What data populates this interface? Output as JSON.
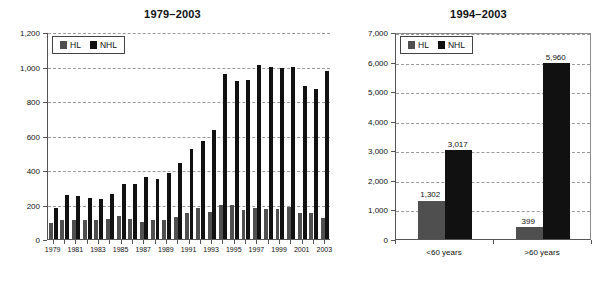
{
  "figure": {
    "background": "#ffffff",
    "hl_color": "#4f4f4f",
    "nhl_color": "#111111",
    "grid_color": "#9a9a9a",
    "axis_color": "#555555"
  },
  "legend": {
    "hl_label": "HL",
    "nhl_label": "NHL"
  },
  "chart_data": [
    {
      "type": "bar",
      "id": "left",
      "title": "1979–2003",
      "xlabel": "",
      "ylabel": "",
      "ylim": [
        0,
        1200
      ],
      "yticks": [
        0,
        200,
        400,
        600,
        800,
        1000,
        1200
      ],
      "ytick_labels": [
        "0",
        "200",
        "400",
        "600",
        "800",
        "1,000",
        "1,200"
      ],
      "grid": true,
      "legend_position": "upper-left",
      "categories": [
        "1979",
        "1980",
        "1981",
        "1982",
        "1983",
        "1984",
        "1985",
        "1986",
        "1987",
        "1988",
        "1989",
        "1990",
        "1991",
        "1992",
        "1993",
        "1994",
        "1995",
        "1996",
        "1997",
        "1998",
        "1999",
        "2000",
        "2001",
        "2002",
        "2003"
      ],
      "xtick_labels": [
        "1979",
        "",
        "1981",
        "",
        "1983",
        "",
        "1985",
        "",
        "1987",
        "",
        "1989",
        "",
        "1991",
        "",
        "1993",
        "",
        "1995",
        "",
        "1997",
        "",
        "1999",
        "",
        "2001",
        "",
        "2003"
      ],
      "series": [
        {
          "name": "HL",
          "color": "#4f4f4f",
          "values": [
            95,
            112,
            108,
            112,
            108,
            117,
            136,
            117,
            96,
            111,
            110,
            125,
            148,
            182,
            154,
            198,
            195,
            167,
            178,
            173,
            175,
            186,
            150,
            150,
            119
          ]
        },
        {
          "name": "NHL",
          "color": "#111111",
          "values": [
            181,
            253,
            248,
            238,
            230,
            261,
            317,
            320,
            361,
            348,
            380,
            440,
            522,
            570,
            631,
            958,
            917,
            923,
            1006,
            995,
            990,
            996,
            886,
            871,
            974
          ]
        }
      ]
    },
    {
      "type": "bar",
      "id": "right",
      "title": "1994–2003",
      "xlabel": "",
      "ylabel": "",
      "ylim": [
        0,
        7000
      ],
      "yticks": [
        0,
        1000,
        2000,
        3000,
        4000,
        5000,
        6000,
        7000
      ],
      "ytick_labels": [
        "0",
        "1,000",
        "2,000",
        "3,000",
        "4,000",
        "5,000",
        "6,000",
        "7,000"
      ],
      "grid": true,
      "legend_position": "upper-left",
      "categories": [
        "<60 years",
        ">60 years"
      ],
      "series": [
        {
          "name": "HL",
          "color": "#4f4f4f",
          "values": [
            1302,
            399
          ],
          "data_labels": [
            "1,302",
            "399"
          ]
        },
        {
          "name": "NHL",
          "color": "#111111",
          "values": [
            3017,
            5960
          ],
          "data_labels": [
            "3,017",
            "5,960"
          ]
        }
      ]
    }
  ]
}
